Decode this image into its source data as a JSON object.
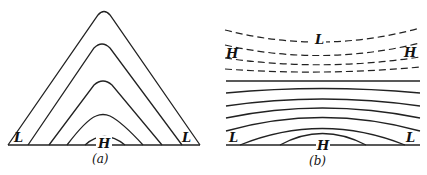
{
  "panels": [
    {
      "id": "a",
      "caption": "(a)",
      "labels": {
        "left": "L",
        "center": "H",
        "right": "L"
      },
      "description": "Nested inverted-V contour lines (isobars) over a flat base line; high pressure H at center bottom, low pressure L at both base corners"
    },
    {
      "id": "b",
      "caption": "(b)",
      "labels": {
        "top_center": "L",
        "top_left": "H",
        "top_right": "H",
        "bottom_left": "L",
        "bottom_center": "H",
        "bottom_right": "L"
      },
      "description": "Upper dashed contours curving upward toward the edges with L at top center and H at the sides; lower solid contours arching over a base line with H at bottom center and L at the bottom corners"
    }
  ],
  "colors": {
    "line": "#222222",
    "background": "#ffffff"
  }
}
